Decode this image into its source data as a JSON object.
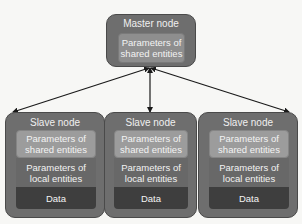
{
  "diagram": {
    "master": {
      "title": "Master node",
      "inner_label_line1": "Parameters of",
      "inner_label_line2": "shared entities"
    },
    "slaves": [
      {
        "title": "Slave node",
        "shared_line1": "Parameters of",
        "shared_line2": "shared entities",
        "local_line1": "Parameters of",
        "local_line2": "local entities",
        "data": "Data"
      },
      {
        "title": "Slave node",
        "shared_line1": "Parameters of",
        "shared_line2": "shared entities",
        "local_line1": "Parameters of",
        "local_line2": "local entities",
        "data": "Data"
      },
      {
        "title": "Slave node",
        "shared_line1": "Parameters of",
        "shared_line2": "shared entities",
        "local_line1": "Parameters of",
        "local_line2": "local entities",
        "data": "Data"
      }
    ],
    "edges": [
      {
        "from": "master",
        "to": "slave-1",
        "direction": "bidirectional"
      },
      {
        "from": "master",
        "to": "slave-2",
        "direction": "bidirectional"
      },
      {
        "from": "master",
        "to": "slave-3",
        "direction": "bidirectional"
      }
    ],
    "colors": {
      "node_bg": "#6e6e6e",
      "shared_params": "#9c9c9c",
      "local_params": "#686868",
      "data": "#3e3e3e",
      "arrow": "#1a1a1a"
    }
  }
}
